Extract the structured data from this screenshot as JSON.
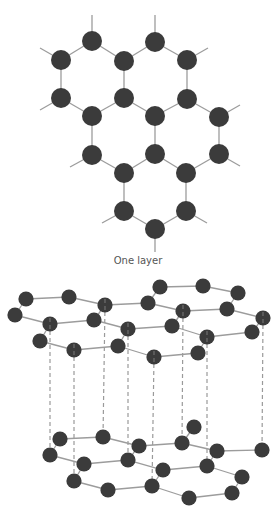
{
  "figure": {
    "caption": "One layer",
    "colors": {
      "atom": "#3b3b3b",
      "bond": "#9c9c9c",
      "interlayer": "#9a9a9a",
      "label": "#555555"
    },
    "single_layer": {
      "atom_radius": 10,
      "atoms": [
        [
          92,
          41
        ],
        [
          155,
          42
        ],
        [
          61,
          60
        ],
        [
          124,
          61
        ],
        [
          187,
          60
        ],
        [
          61,
          98
        ],
        [
          124,
          98
        ],
        [
          187,
          99
        ],
        [
          92,
          116
        ],
        [
          155,
          116
        ],
        [
          219,
          117
        ],
        [
          92,
          155
        ],
        [
          155,
          154
        ],
        [
          219,
          154
        ],
        [
          124,
          173
        ],
        [
          186,
          173
        ],
        [
          124,
          211
        ],
        [
          186,
          211
        ],
        [
          155,
          229
        ]
      ],
      "bonds": [
        [
          0,
          2
        ],
        [
          0,
          3
        ],
        [
          1,
          3
        ],
        [
          1,
          4
        ],
        [
          2,
          5
        ],
        [
          3,
          6
        ],
        [
          4,
          7
        ],
        [
          5,
          8
        ],
        [
          6,
          8
        ],
        [
          6,
          9
        ],
        [
          7,
          9
        ],
        [
          7,
          10
        ],
        [
          8,
          11
        ],
        [
          9,
          12
        ],
        [
          10,
          13
        ],
        [
          11,
          14
        ],
        [
          12,
          14
        ],
        [
          12,
          15
        ],
        [
          13,
          15
        ],
        [
          14,
          16
        ],
        [
          15,
          17
        ],
        [
          16,
          18
        ],
        [
          17,
          18
        ]
      ],
      "stubs": [
        [
          0,
          92,
          15
        ],
        [
          1,
          155,
          15
        ],
        [
          2,
          40,
          48
        ],
        [
          4,
          208,
          48
        ],
        [
          5,
          40,
          110
        ],
        [
          10,
          240,
          105
        ],
        [
          13,
          240,
          166
        ],
        [
          11,
          70,
          167
        ],
        [
          16,
          102,
          223
        ],
        [
          17,
          207,
          223
        ],
        [
          18,
          155,
          252
        ]
      ]
    },
    "stack": {
      "atom_radius": 7.6,
      "top_layer": {
        "atoms": [
          [
            26,
            299
          ],
          [
            69,
            297
          ],
          [
            105,
            305
          ],
          [
            148,
            303
          ],
          [
            160,
            287
          ],
          [
            203,
            286
          ],
          [
            238,
            293
          ],
          [
            15,
            315
          ],
          [
            50,
            324
          ],
          [
            94,
            320
          ],
          [
            183,
            311
          ],
          [
            227,
            309
          ],
          [
            263,
            318
          ],
          [
            128,
            329
          ],
          [
            172,
            326
          ],
          [
            207,
            337
          ],
          [
            252,
            332
          ],
          [
            40,
            341
          ],
          [
            74,
            350
          ],
          [
            118,
            346
          ],
          [
            154,
            357
          ],
          [
            198,
            353
          ]
        ],
        "bonds": [
          [
            0,
            1
          ],
          [
            1,
            2
          ],
          [
            2,
            3
          ],
          [
            3,
            4
          ],
          [
            4,
            5
          ],
          [
            5,
            6
          ],
          [
            6,
            11
          ],
          [
            11,
            10
          ],
          [
            10,
            3
          ],
          [
            0,
            7
          ],
          [
            7,
            8
          ],
          [
            8,
            9
          ],
          [
            9,
            2
          ],
          [
            8,
            17
          ],
          [
            17,
            18
          ],
          [
            18,
            19
          ],
          [
            19,
            13
          ],
          [
            13,
            9
          ],
          [
            13,
            14
          ],
          [
            14,
            10
          ],
          [
            14,
            15
          ],
          [
            11,
            12
          ],
          [
            12,
            16
          ],
          [
            16,
            15
          ],
          [
            15,
            21
          ],
          [
            21,
            20
          ],
          [
            20,
            19
          ]
        ]
      },
      "bottom_layer": {
        "atoms": [
          [
            60,
            439
          ],
          [
            103,
            437
          ],
          [
            139,
            446
          ],
          [
            182,
            443
          ],
          [
            194,
            427
          ],
          [
            50,
            455
          ],
          [
            84,
            464
          ],
          [
            128,
            460
          ],
          [
            217,
            451
          ],
          [
            262,
            450
          ],
          [
            74,
            481
          ],
          [
            163,
            470
          ],
          [
            207,
            466
          ],
          [
            108,
            490
          ],
          [
            152,
            486
          ],
          [
            242,
            477
          ],
          [
            189,
            498
          ],
          [
            232,
            493
          ]
        ],
        "bonds": [
          [
            0,
            1
          ],
          [
            1,
            2
          ],
          [
            0,
            5
          ],
          [
            5,
            6
          ],
          [
            6,
            7
          ],
          [
            6,
            10
          ],
          [
            10,
            13
          ],
          [
            13,
            14
          ],
          [
            7,
            2
          ],
          [
            7,
            11
          ],
          [
            14,
            11
          ],
          [
            2,
            3
          ],
          [
            3,
            4
          ],
          [
            3,
            8
          ],
          [
            8,
            9
          ],
          [
            8,
            12
          ],
          [
            11,
            12
          ],
          [
            12,
            15
          ],
          [
            15,
            17
          ],
          [
            17,
            16
          ],
          [
            16,
            14
          ]
        ]
      },
      "interlayer_lines": [
        [
          50,
          324,
          50,
          455
        ],
        [
          74,
          350,
          74,
          481
        ],
        [
          105,
          305,
          103,
          437
        ],
        [
          128,
          329,
          128,
          460
        ],
        [
          154,
          357,
          152,
          486
        ],
        [
          183,
          311,
          182,
          443
        ],
        [
          207,
          337,
          207,
          466
        ],
        [
          263,
          318,
          262,
          450
        ]
      ]
    }
  }
}
